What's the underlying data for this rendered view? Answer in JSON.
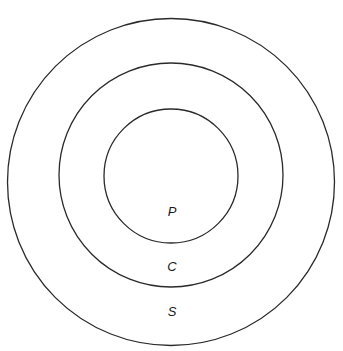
{
  "diagram": {
    "type": "concentric-circles",
    "stroke_color": "#2a2a2a",
    "background": "#ffffff",
    "rings": [
      {
        "id": "outer",
        "label": "S",
        "cx": 171,
        "cy": 182,
        "r": 163.5,
        "label_x": 172,
        "label_y": 313
      },
      {
        "id": "middle",
        "label": "C",
        "cx": 171,
        "cy": 175,
        "r": 112,
        "label_x": 172,
        "label_y": 268
      },
      {
        "id": "inner",
        "label": "P",
        "cx": 171,
        "cy": 176,
        "r": 67,
        "label_x": 172,
        "label_y": 213
      }
    ]
  }
}
